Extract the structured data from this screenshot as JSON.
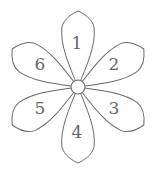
{
  "diagram": {
    "type": "numbered-flower",
    "center": {
      "x": 78,
      "y": 87,
      "radius": 7
    },
    "petal_length": 76,
    "petal_half_width": 17,
    "colors": {
      "stroke": "#6a6a6a",
      "fill": "#ffffff",
      "label": "#666666",
      "background": "#ffffff"
    },
    "petals": [
      {
        "label": "1",
        "angle": 0,
        "label_pos": {
          "x": 77,
          "y": 43
        }
      },
      {
        "label": "2",
        "angle": 60,
        "label_pos": {
          "x": 114,
          "y": 64
        }
      },
      {
        "label": "3",
        "angle": 120,
        "label_pos": {
          "x": 114,
          "y": 108
        }
      },
      {
        "label": "4",
        "angle": 180,
        "label_pos": {
          "x": 77,
          "y": 132
        }
      },
      {
        "label": "5",
        "angle": 240,
        "label_pos": {
          "x": 40,
          "y": 108
        }
      },
      {
        "label": "6",
        "angle": 300,
        "label_pos": {
          "x": 40,
          "y": 64
        }
      }
    ]
  }
}
